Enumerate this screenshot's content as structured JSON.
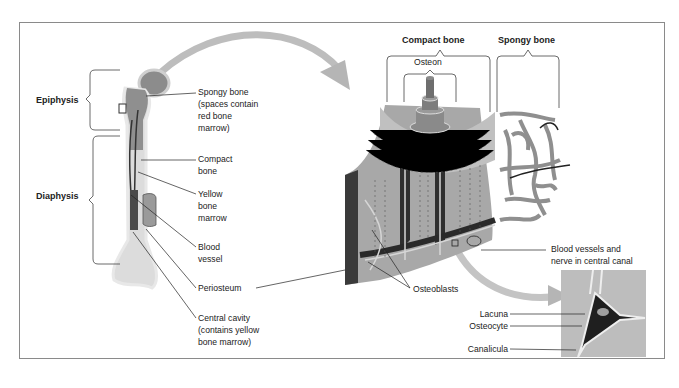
{
  "diagram": {
    "regions": {
      "epiphysis": "Epiphysis",
      "diaphysis": "Diaphysis"
    },
    "long_bone_labels": [
      {
        "id": "spongy-bone",
        "text": "Spongy bone\n(spaces contain\nred bone\nmarrow)"
      },
      {
        "id": "compact-bone",
        "text": "Compact\nbone"
      },
      {
        "id": "yellow-bone-marrow",
        "text": "Yellow\nbone\nmarrow"
      },
      {
        "id": "blood-vessel",
        "text": "Blood\nvessel"
      },
      {
        "id": "periosteum",
        "text": "Periosteum"
      },
      {
        "id": "central-cavity",
        "text": "Central cavity\n(contains yellow\nbone marrow)"
      }
    ],
    "detail_labels": {
      "compact_bone": "Compact bone",
      "spongy_bone": "Spongy bone",
      "osteon": "Osteon",
      "osteoblasts": "Osteoblasts",
      "blood_vessels_nerve": "Blood vessels and\nnerve in central canal"
    },
    "cell_labels": {
      "lacuna": "Lacuna",
      "osteocyte": "Osteocyte",
      "canalicula": "Canalicula"
    },
    "colors": {
      "bone_light": "#e6e6e6",
      "bone_mid": "#9a9a9a",
      "bone_dark": "#3a3a3a",
      "arrow": "#b5b5b5",
      "frame": "#8a8a8a"
    }
  }
}
